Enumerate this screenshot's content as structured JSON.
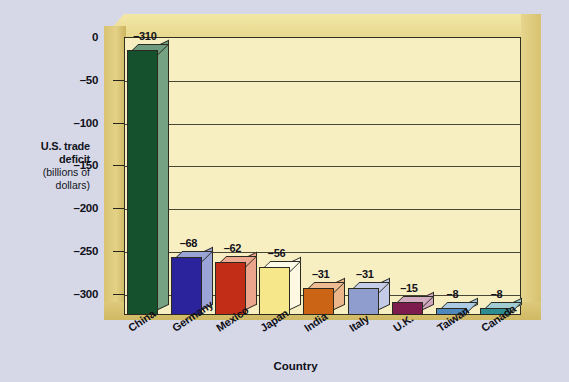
{
  "chart_data": {
    "type": "bar",
    "title": "",
    "subtitle": "",
    "xlabel": "Country",
    "ylabel": "U.S. trade deficit (billions of dollars)",
    "ylabel_lines": [
      "U.S. trade",
      "deficit",
      "(billions of",
      "dollars)"
    ],
    "categories": [
      "China",
      "Germany",
      "Mexico",
      "Japan",
      "India",
      "Italy",
      "U.K.",
      "Taiwan",
      "Canada"
    ],
    "values": [
      -310,
      -68,
      -62,
      -56,
      -31,
      -31,
      -15,
      -8,
      -8
    ],
    "value_labels": [
      "–310",
      "–68",
      "–62",
      "–56",
      "–31",
      "–31",
      "–15",
      "–8",
      "–8"
    ],
    "ylim": [
      -325,
      0
    ],
    "yticks": [
      -300,
      -250,
      -200,
      -150,
      -100,
      -50,
      0
    ],
    "ytick_labels": [
      "–300",
      "–250",
      "–200",
      "–150",
      "–100",
      "–50",
      "0"
    ],
    "grid": true,
    "legend": "none",
    "bar_colors": [
      {
        "country": "China",
        "front": "#14512c",
        "side": "#74a283",
        "top": "#6f9c80"
      },
      {
        "country": "Germany",
        "front": "#2a239c",
        "side": "#9ba4d6",
        "top": "#9aa3d5"
      },
      {
        "country": "Mexico",
        "front": "#c22d17",
        "side": "#eba58d",
        "top": "#eda990"
      },
      {
        "country": "Japan",
        "front": "#f6e88a",
        "side": "#fdf8e2",
        "top": "#fdfae8"
      },
      {
        "country": "India",
        "front": "#cc6416",
        "side": "#edb68a",
        "top": "#eebb92"
      },
      {
        "country": "Italy",
        "front": "#8f9dce",
        "side": "#c3cbe6",
        "top": "#c6cde8"
      },
      {
        "country": "U.K.",
        "front": "#7d1a4e",
        "side": "#cfa6bd",
        "top": "#d2abc1"
      },
      {
        "country": "Taiwan",
        "front": "#4e88bd",
        "side": "#a9c7e0",
        "top": "#accae3"
      },
      {
        "country": "Canada",
        "front": "#2e8c93",
        "side": "#9ccad0",
        "top": "#a0ccd2"
      }
    ],
    "palette": {
      "page_background": "#d6d8e8",
      "plot_panel": "#f7eec2",
      "frame": "#e3d186",
      "gridline": "#4a4636",
      "text": "#101018"
    }
  }
}
